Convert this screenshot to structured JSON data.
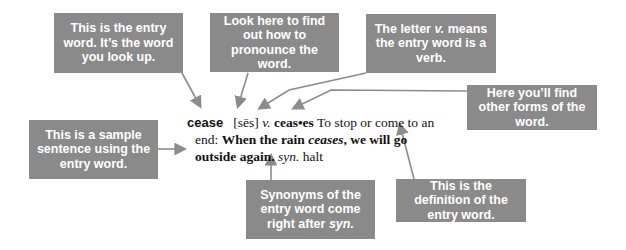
{
  "callouts": {
    "entry_word": "This is the entry word. It’s the word you look up.",
    "pronounce": "Look here to find out how to pronounce the word.",
    "verb_prefix": "The letter ",
    "verb_letter": "v.",
    "verb_suffix": " means the entry word is a verb.",
    "other_forms": "Here you’ll find other forms of the word.",
    "sample": "This is a sample sentence using the entry word.",
    "syn_prefix": "Synonyms of the entry word come right after ",
    "syn_word": "syn.",
    "definition": "This is the definition of the entry word."
  },
  "entry": {
    "headword": "cease",
    "pronunciation": "[sēs]",
    "part_of_speech": "v.",
    "inflection": "ceas•es",
    "definition_line1": "To stop or come to an",
    "definition_line2": "end:",
    "sentence_a": "When the rain",
    "sentence_italic": "ceases",
    "sentence_b": ", we will go",
    "sentence_c": "outside again.",
    "syn_label": "syn.",
    "synonym": "halt"
  },
  "colors": {
    "box": "#8a8a8a",
    "arrow": "#8c8c8c",
    "text": "#111111"
  }
}
